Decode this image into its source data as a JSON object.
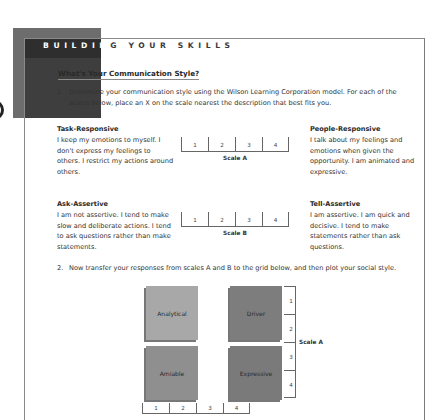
{
  "header": {
    "section_title_white": "BUILDIN",
    "section_title_dark": "G YOUR SKILLS"
  },
  "page_heading": "What's Your Communication Style?",
  "steps": [
    {
      "num": "1.",
      "text": "Determine your communication style using the Wilson Learning Corporation model. For each of the scales below, place an X on the scale nearest the description that best fits you."
    },
    {
      "num": "2.",
      "text": "Now transfer your responses from scales A and B to the grid below, and then plot your social style."
    }
  ],
  "scale_a": {
    "left": {
      "title": "Task-Responsive",
      "text": "I keep my emotions to myself. I don't express my feelings to others. I restrict my actions around others."
    },
    "right": {
      "title": "People-Responsive",
      "text": "I talk about my feelings and emotions when given the opportunity. I am animated and expressive."
    },
    "cells": [
      "1",
      "2",
      "3",
      "4"
    ],
    "caption": "Scale A"
  },
  "scale_b": {
    "left": {
      "title": "Ask-Assertive",
      "text": "I am not assertive. I tend to make slow and deliberate actions. I tend to ask questions rather than make statements."
    },
    "right": {
      "title": "Tell-Assertive",
      "text": "I am assertive. I am quick and decisive. I tend to make statements rather than ask questions."
    },
    "cells": [
      "1",
      "2",
      "3",
      "4"
    ],
    "caption": "Scale B"
  },
  "grid": {
    "quadrants": [
      "Analytical",
      "Driver",
      "Amiable",
      "Expressive"
    ],
    "vertical_scale": {
      "cells": [
        "1",
        "2",
        "3",
        "4"
      ],
      "caption": "Scale A"
    },
    "horizontal_scale": {
      "cells": [
        "1",
        "2",
        "3",
        "4"
      ]
    }
  }
}
